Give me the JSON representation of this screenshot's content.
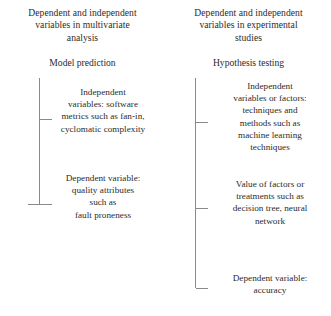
{
  "diagram": {
    "type": "two-column-bracket-diagram",
    "line_color": "#8a8a8a",
    "text_color": "#2b2b2b",
    "background_color": "#ffffff"
  },
  "left_column": {
    "heading": {
      "line1": "Dependent and independent",
      "line2": "variables in multivariate",
      "line3": "analysis"
    },
    "subheading": "Model prediction",
    "branches": [
      {
        "name": "independent-variables",
        "lines": [
          "Independent",
          "variables: software",
          "metrics such as fan-in,",
          "cyclomatic complexity"
        ]
      },
      {
        "name": "dependent-variable",
        "lines": [
          "Dependent variable:",
          "quality attributes",
          "such as",
          "fault proneness"
        ]
      }
    ]
  },
  "right_column": {
    "heading": {
      "line1": "Dependent and independent",
      "line2": "variables in experimental",
      "line3": "studies"
    },
    "subheading": "Hypothesis testing",
    "branches": [
      {
        "name": "independent-variables-or-factors",
        "lines": [
          "Independent",
          "variables or factors:",
          "techniques and",
          "methods such as",
          "machine learning",
          "techniques"
        ]
      },
      {
        "name": "value-of-factors",
        "lines": [
          "Value of factors or",
          "treatments such as",
          "decision tree, neural",
          "network"
        ]
      },
      {
        "name": "dependent-variable",
        "lines": [
          "Dependent variable:",
          "accuracy"
        ]
      }
    ]
  }
}
